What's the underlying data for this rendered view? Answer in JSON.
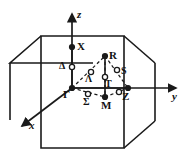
{
  "figure": {
    "background_color": "#ffffff",
    "line_color": "#1a1a1a",
    "text_color": "#111111"
  },
  "axes": [
    {
      "name": "z-axis",
      "label": "z",
      "direction": "up"
    },
    {
      "name": "y-axis",
      "label": "y",
      "direction": "right"
    },
    {
      "name": "x-axis",
      "label": "x",
      "direction": "down-left"
    }
  ],
  "symmetry_points": [
    {
      "id": "gamma",
      "label": "Γ",
      "marker": "filled",
      "x": 72,
      "y": 88,
      "label_x": 64,
      "label_y": 90
    },
    {
      "id": "x-point",
      "label": "X",
      "marker": "filled",
      "x": 72,
      "y": 47,
      "label_x": 77,
      "label_y": 42
    },
    {
      "id": "r-point",
      "label": "R",
      "marker": "filled",
      "x": 105,
      "y": 56,
      "label_x": 109,
      "label_y": 51
    },
    {
      "id": "z-point",
      "label": "Z",
      "marker": "filled",
      "x": 128,
      "y": 88,
      "label_x": 121,
      "label_y": 91
    },
    {
      "id": "m-point",
      "label": "M",
      "marker": "filled",
      "x": 105,
      "y": 97,
      "label_x": 100,
      "label_y": 100
    }
  ],
  "symmetry_lines": [
    {
      "id": "delta-line",
      "label": "Δ",
      "marker": "open",
      "x": 72,
      "y": 67,
      "label_x": 60,
      "label_y": 62
    },
    {
      "id": "lambda-line",
      "label": "Λ",
      "marker": "open",
      "x": 91,
      "y": 74,
      "label_x": 86,
      "label_y": 74
    },
    {
      "id": "sigma-line",
      "label": "Σ",
      "marker": "open",
      "x": 88,
      "y": 95,
      "label_x": 83,
      "label_y": 98
    },
    {
      "id": "s-line",
      "label": "S",
      "marker": "open",
      "x": 117,
      "y": 71,
      "label_x": 121,
      "label_y": 67
    },
    {
      "id": "t-line",
      "label": "T",
      "marker": "open",
      "x": 105,
      "y": 77,
      "label_x": 105,
      "label_y": 80
    },
    {
      "id": "a-line",
      "label": "",
      "marker": "open",
      "x": 120,
      "y": 93,
      "label_x": 0,
      "label_y": 0
    }
  ],
  "cube": {
    "name": "brillouin-zone-cube",
    "front_face": [
      [
        41,
        36
      ],
      [
        124,
        36
      ],
      [
        124,
        148
      ],
      [
        41,
        148
      ]
    ],
    "top_back": [
      [
        10,
        63
      ],
      [
        93,
        63
      ]
    ],
    "right_back": [
      [
        155,
        63
      ],
      [
        155,
        121
      ]
    ]
  }
}
